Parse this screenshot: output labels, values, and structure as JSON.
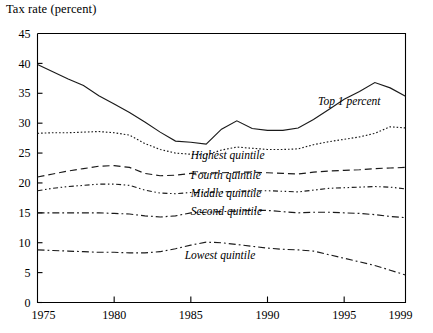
{
  "chart_data": {
    "type": "line",
    "title": "Tax rate (percent)",
    "xlabel": "",
    "ylabel": "Tax rate (percent)",
    "xlim": [
      1975,
      1999
    ],
    "ylim": [
      0,
      45
    ],
    "yticks": [
      0,
      5,
      10,
      15,
      20,
      25,
      30,
      35,
      40,
      45
    ],
    "xticks": [
      1975,
      1980,
      1985,
      1990,
      1995,
      1999
    ],
    "grid": false,
    "legend_position": "inline-labels",
    "x": [
      1975,
      1976,
      1977,
      1978,
      1979,
      1980,
      1981,
      1982,
      1983,
      1984,
      1985,
      1986,
      1987,
      1988,
      1989,
      1990,
      1991,
      1992,
      1993,
      1994,
      1995,
      1996,
      1997,
      1998,
      1999
    ],
    "series": [
      {
        "name": "Top 1 percent",
        "style": "solid",
        "label_x": 1993.3,
        "label_y": 33.0,
        "values": [
          39.8,
          38.6,
          37.4,
          36.3,
          34.6,
          33.2,
          31.8,
          30.2,
          28.5,
          27.0,
          26.8,
          26.5,
          29.0,
          30.4,
          29.1,
          28.8,
          28.8,
          29.2,
          30.6,
          32.3,
          34.0,
          35.3,
          36.8,
          35.9,
          34.5
        ]
      },
      {
        "name": "Highest quintile",
        "style": "dotted",
        "label_x": 1985.0,
        "label_y": 24.0,
        "values": [
          28.3,
          28.4,
          28.4,
          28.5,
          28.6,
          28.4,
          28.0,
          26.6,
          25.6,
          25.0,
          24.8,
          24.7,
          25.5,
          26.0,
          25.8,
          25.6,
          25.6,
          25.7,
          26.4,
          26.9,
          27.3,
          27.7,
          28.3,
          29.4,
          29.2
        ]
      },
      {
        "name": "Fourth quintile",
        "style": "dashed",
        "label_x": 1985.0,
        "label_y": 20.6,
        "values": [
          21.0,
          21.5,
          22.0,
          22.4,
          22.8,
          22.9,
          22.6,
          21.6,
          21.2,
          21.3,
          21.6,
          21.7,
          21.7,
          21.8,
          21.8,
          21.7,
          21.6,
          21.5,
          21.8,
          22.0,
          22.1,
          22.2,
          22.4,
          22.5,
          22.6
        ]
      },
      {
        "name": "Middle quintile",
        "style": "dashdotdot",
        "label_x": 1985.0,
        "label_y": 17.6,
        "values": [
          18.7,
          19.1,
          19.4,
          19.6,
          19.8,
          19.8,
          19.6,
          18.8,
          18.3,
          18.2,
          18.4,
          18.4,
          18.5,
          18.6,
          18.7,
          18.7,
          18.6,
          18.5,
          18.8,
          19.1,
          19.2,
          19.3,
          19.4,
          19.3,
          19.0
        ]
      },
      {
        "name": "Second quintile",
        "style": "dashdot",
        "label_x": 1985.0,
        "label_y": 14.6,
        "values": [
          15.0,
          15.0,
          15.0,
          15.0,
          15.0,
          14.9,
          14.8,
          14.5,
          14.3,
          14.5,
          15.0,
          15.1,
          15.2,
          15.3,
          15.4,
          15.4,
          15.2,
          15.0,
          15.1,
          15.1,
          15.0,
          14.9,
          14.7,
          14.4,
          14.2
        ]
      },
      {
        "name": "Lowest quintile",
        "style": "dashdot",
        "label_x": 1984.6,
        "label_y": 7.3,
        "values": [
          8.8,
          8.7,
          8.6,
          8.5,
          8.4,
          8.4,
          8.3,
          8.3,
          8.5,
          9.0,
          9.6,
          10.1,
          10.0,
          9.7,
          9.4,
          9.1,
          8.9,
          8.8,
          8.6,
          8.0,
          7.4,
          6.8,
          6.2,
          5.4,
          4.6
        ]
      }
    ]
  },
  "axis": {
    "y_tick_labels": [
      "45",
      "40",
      "35",
      "30",
      "25",
      "20",
      "15",
      "10",
      "5",
      "0"
    ],
    "x_tick_labels": [
      "1975",
      "1980",
      "1985",
      "1990",
      "1995",
      "1999"
    ]
  },
  "labels": {
    "top_1_percent": "Top 1 percent",
    "highest_quintile": "Highest quintile",
    "fourth_quintile": "Fourth quintile",
    "middle_quintile": "Middle quintile",
    "second_quintile": "Second quintile",
    "lowest_quintile": "Lowest quintile",
    "axis_title": "Tax rate (percent)"
  },
  "colors": {
    "line": "#1a1a1a",
    "axis": "#000000",
    "background": "#ffffff"
  }
}
